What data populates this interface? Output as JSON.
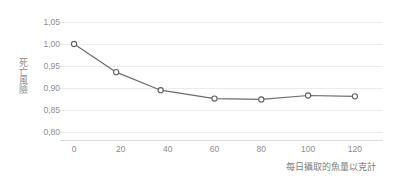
{
  "chart_data": {
    "type": "line",
    "title": "",
    "subtitle": "",
    "xlabel": "每日攝取的魚量以克計",
    "ylabel": "死亡風險",
    "x": [
      0,
      18,
      37,
      60,
      80,
      100,
      120
    ],
    "values": [
      1.0,
      0.936,
      0.895,
      0.876,
      0.874,
      0.883,
      0.881
    ],
    "series": [
      {
        "name": "死亡風險",
        "x": [
          0,
          18,
          37,
          60,
          80,
          100,
          120
        ],
        "values": [
          1.0,
          0.936,
          0.895,
          0.876,
          0.874,
          0.883,
          0.881
        ]
      }
    ],
    "xlim": [
      -6,
      132
    ],
    "ylim": [
      0.8,
      1.05
    ],
    "xticks": [
      0,
      20,
      40,
      60,
      80,
      100,
      120
    ],
    "xtick_labels": [
      "0",
      "20",
      "40",
      "60",
      "80",
      "100",
      "120"
    ],
    "yticks": [
      0.8,
      0.85,
      0.9,
      0.95,
      1.0,
      1.05
    ],
    "ytick_labels": [
      "0,80",
      "0,85",
      "0,90",
      "0,95",
      "1,00",
      "1,05"
    ],
    "grid": "horizontal",
    "legend": "none",
    "marker": "open-circle",
    "line_color": "#6b6b6b",
    "marker_fill": "#ffffff",
    "marker_edge": "#5f5f5f",
    "grid_color": "#ebebeb",
    "axis_color": "#d9d9d9",
    "tick_label_color": "#8c8c8c",
    "axis_title_color": "#7d7d7d",
    "background": "#ffffff"
  }
}
